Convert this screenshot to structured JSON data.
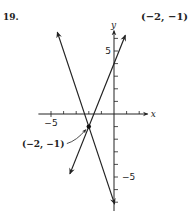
{
  "problem": {
    "number": "19.",
    "answer": "(−2, −1)"
  },
  "chart_data": {
    "type": "line",
    "title": "",
    "xlabel": "x",
    "ylabel": "y",
    "xlim": [
      -6,
      2.2
    ],
    "ylim": [
      -7.7,
      6.3
    ],
    "grid": false,
    "x_ticks": [
      -5,
      -4,
      -3,
      -2,
      -1,
      1,
      2
    ],
    "y_ticks": [
      -7,
      -6,
      -5,
      -4,
      -3,
      -2,
      -1,
      1,
      2,
      3,
      4,
      5,
      6
    ],
    "x_tick_labels": [
      {
        "value": -5,
        "label": "−5"
      }
    ],
    "y_tick_labels": [
      {
        "value": 5,
        "label": "5"
      },
      {
        "value": -5,
        "label": "−5"
      }
    ],
    "series": [
      {
        "name": "line-1",
        "equation": "y = -3x - 7",
        "x": [
          -4.5,
          0.05
        ],
        "y": [
          6.5,
          -7.15
        ]
      },
      {
        "name": "line-2",
        "equation": "y = 2.5x + 4",
        "x": [
          -3.5,
          0.9
        ],
        "y": [
          -4.75,
          6.25
        ]
      }
    ],
    "annotations": [
      {
        "label": "(−2, −1)",
        "x": -2,
        "y": -1,
        "marker": "point"
      }
    ]
  }
}
